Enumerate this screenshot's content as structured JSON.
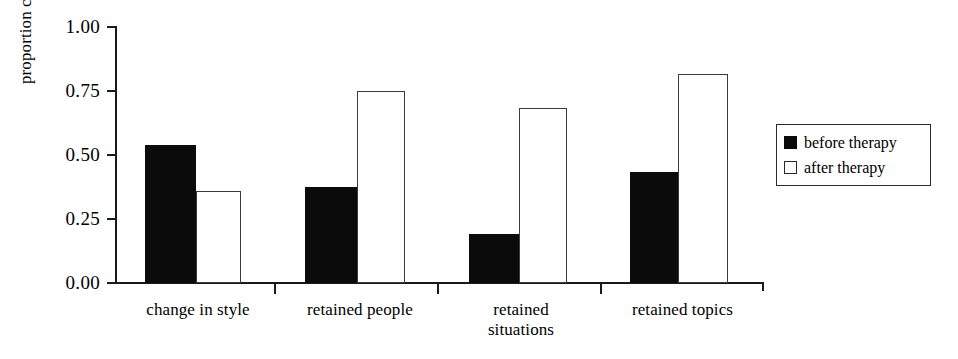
{
  "chart_data": {
    "type": "bar",
    "title": "",
    "xlabel": "",
    "ylabel": "proportion change",
    "ylim": [
      0,
      1.0
    ],
    "ytick_labels": [
      "0.00",
      "0.25",
      "0.50",
      "0.75",
      "1.00"
    ],
    "ytick_values": [
      0.0,
      0.25,
      0.5,
      0.75,
      1.0
    ],
    "grid": false,
    "legend_position": "right",
    "categories": [
      "change in style",
      "retained people",
      "retained situations",
      "retained topics"
    ],
    "category_lines": [
      [
        "change in style"
      ],
      [
        "retained people"
      ],
      [
        "retained",
        "situations"
      ],
      [
        "retained topics"
      ]
    ],
    "series": [
      {
        "name": "before therapy",
        "color": "#000000",
        "fill": "solid",
        "values": [
          0.54,
          0.375,
          0.19,
          0.435
        ]
      },
      {
        "name": "after therapy",
        "color": "#ffffff",
        "fill": "open",
        "values": [
          0.36,
          0.75,
          0.685,
          0.815
        ]
      }
    ]
  },
  "legend": {
    "entries": [
      {
        "label": "before therapy",
        "swatch": "filled-black-square"
      },
      {
        "label": "after therapy",
        "swatch": "open-white-square"
      }
    ]
  },
  "axes": {
    "y_label": "proportion change",
    "y_ticks": [
      "1.00",
      "0.75",
      "0.50",
      "0.25",
      "0.00"
    ]
  },
  "colors": {
    "before_therapy": "#000000",
    "after_therapy": "#ffffff",
    "axis": "#1a1a1a",
    "background": "#ffffff"
  }
}
